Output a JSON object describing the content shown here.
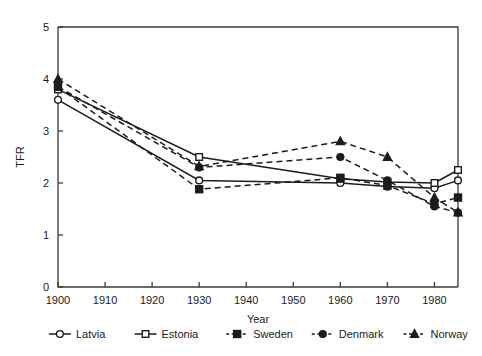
{
  "chart_data": {
    "type": "line",
    "title": "",
    "xlabel": "Year",
    "ylabel": "TFR",
    "xlim": [
      1900,
      1985
    ],
    "ylim": [
      0,
      5
    ],
    "xticks": [
      1900,
      1910,
      1920,
      1930,
      1940,
      1950,
      1960,
      1970,
      1980
    ],
    "yticks": [
      0,
      1,
      2,
      3,
      4,
      5
    ],
    "grid": false,
    "legend_position": "bottom",
    "x": [
      1900,
      1930,
      1960,
      1970,
      1980,
      1985
    ],
    "series": [
      {
        "name": "Latvia",
        "marker": "open-circle",
        "linestyle": "solid",
        "values": [
          3.6,
          2.05,
          2.0,
          1.93,
          1.9,
          2.05
        ]
      },
      {
        "name": "Estonia",
        "marker": "open-square",
        "linestyle": "solid",
        "values": [
          3.8,
          2.5,
          2.08,
          2.02,
          2.0,
          2.25
        ]
      },
      {
        "name": "Sweden",
        "marker": "filled-square",
        "linestyle": "dashed",
        "values": [
          3.85,
          1.88,
          2.1,
          1.95,
          1.6,
          1.72
        ]
      },
      {
        "name": "Denmark",
        "marker": "filled-circle",
        "linestyle": "dashed",
        "values": [
          3.85,
          2.3,
          2.5,
          2.05,
          1.55,
          1.43
        ]
      },
      {
        "name": "Norway",
        "marker": "filled-triangle",
        "linestyle": "dashed",
        "values": [
          4.0,
          2.32,
          2.8,
          2.5,
          1.72,
          1.43
        ]
      }
    ]
  },
  "axes": {
    "y_label": "TFR",
    "x_label": "Year",
    "y_tick_labels": [
      "0",
      "1",
      "2",
      "3",
      "4",
      "5"
    ],
    "x_tick_labels": [
      "1900",
      "1910",
      "1920",
      "1930",
      "1940",
      "1950",
      "1960",
      "1970",
      "1980"
    ]
  },
  "legend": {
    "items": [
      {
        "label": "Latvia",
        "marker": "open-circle",
        "linestyle": "solid"
      },
      {
        "label": "Estonia",
        "marker": "open-square",
        "linestyle": "solid"
      },
      {
        "label": "Sweden",
        "marker": "filled-square",
        "linestyle": "dashed"
      },
      {
        "label": "Denmark",
        "marker": "filled-circle",
        "linestyle": "dashed"
      },
      {
        "label": "Norway",
        "marker": "filled-triangle",
        "linestyle": "dashed"
      }
    ]
  },
  "colors": {
    "ink": "#1c1c1c",
    "axis": "#3b3b3b",
    "background": "#ffffff"
  }
}
